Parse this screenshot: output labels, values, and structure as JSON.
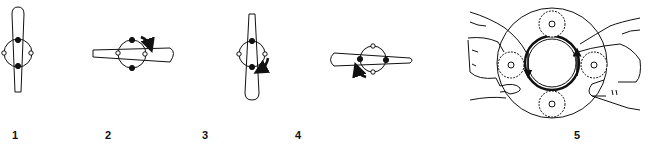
{
  "diagram": {
    "colors": {
      "line": "#111111",
      "background": "#ffffff"
    },
    "steps": [
      {
        "label": "1",
        "orientation": "vertical",
        "rotation_arrow": "none"
      },
      {
        "label": "2",
        "orientation": "horizontal",
        "rotation_arrow": "clockwise-top-right"
      },
      {
        "label": "3",
        "orientation": "vertical",
        "rotation_arrow": "clockwise-bottom-right"
      },
      {
        "label": "4",
        "orientation": "horizontal",
        "rotation_arrow": "counterclockwise-bottom-left"
      },
      {
        "label": "5",
        "orientation": "hands-with-gears",
        "rotation_arrow": "inward-both-sides"
      }
    ]
  }
}
